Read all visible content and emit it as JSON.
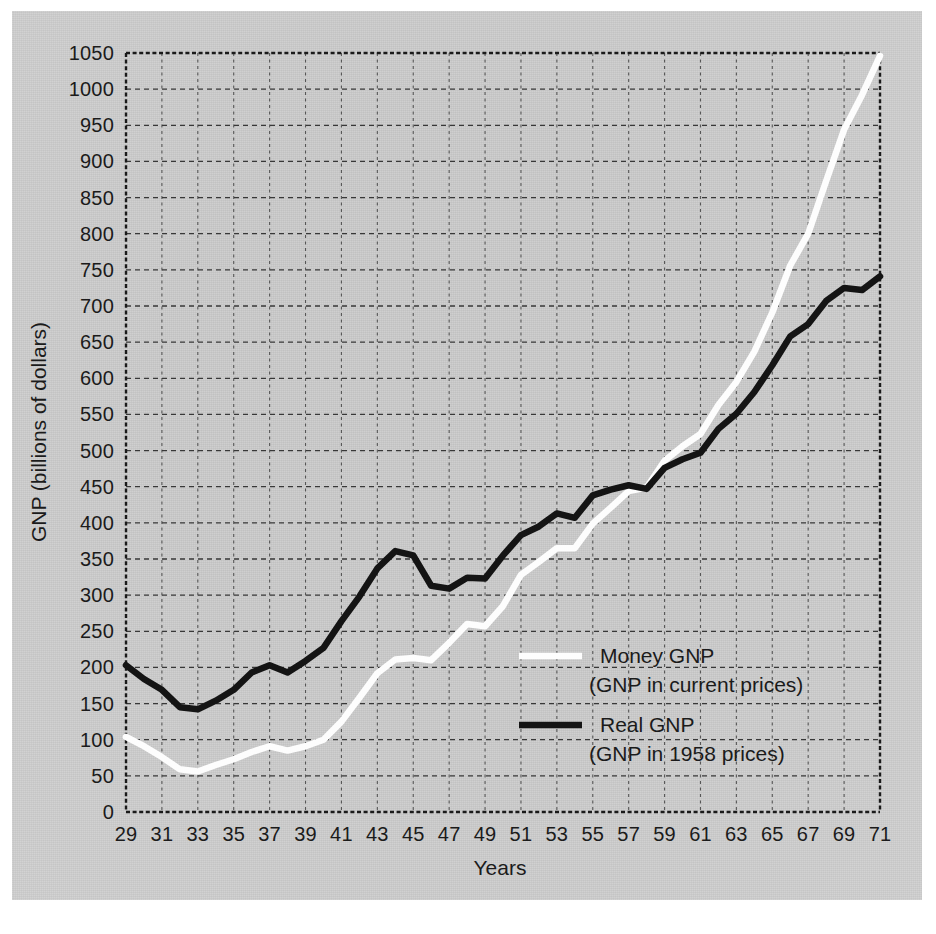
{
  "chart_data": {
    "type": "line",
    "title": "",
    "xlabel": "Years",
    "ylabel": "GNP (billions of dollars)",
    "xlim": [
      29,
      71
    ],
    "ylim": [
      0,
      1050
    ],
    "grid": true,
    "legend_position": "inside-right-lower",
    "x_tick_labels": [
      "29",
      "31",
      "33",
      "35",
      "37",
      "39",
      "41",
      "43",
      "45",
      "47",
      "49",
      "51",
      "53",
      "55",
      "57",
      "59",
      "61",
      "63",
      "65",
      "67",
      "69",
      "71"
    ],
    "y_tick_labels": [
      "0",
      "50",
      "100",
      "150",
      "200",
      "250",
      "300",
      "350",
      "400",
      "450",
      "500",
      "550",
      "600",
      "650",
      "700",
      "750",
      "800",
      "850",
      "900",
      "950",
      "1000",
      "1050"
    ],
    "x": [
      29,
      30,
      31,
      32,
      33,
      34,
      35,
      36,
      37,
      38,
      39,
      40,
      41,
      42,
      43,
      44,
      45,
      46,
      47,
      48,
      49,
      50,
      51,
      52,
      53,
      54,
      55,
      56,
      57,
      58,
      59,
      60,
      61,
      62,
      63,
      64,
      65,
      66,
      67,
      68,
      69,
      70,
      71
    ],
    "series": [
      {
        "name": "Money GNP",
        "sublabel": "(GNP in current prices)",
        "color": "#fdfdfd",
        "values": [
          104,
          91,
          76,
          59,
          56,
          65,
          73,
          83,
          91,
          85,
          91,
          100,
          125,
          158,
          192,
          211,
          213,
          210,
          234,
          260,
          257,
          285,
          328,
          346,
          365,
          365,
          399,
          421,
          444,
          449,
          486,
          506,
          523,
          563,
          595,
          637,
          691,
          756,
          800,
          873,
          944,
          992,
          1046
        ]
      },
      {
        "name": "Real GNP",
        "sublabel": "(GNP in 1958 prices)",
        "color": "#141414",
        "values": [
          203,
          184,
          169,
          145,
          142,
          154,
          169,
          193,
          203,
          193,
          209,
          227,
          264,
          298,
          337,
          361,
          355,
          313,
          309,
          324,
          323,
          355,
          383,
          395,
          413,
          407,
          438,
          446,
          452,
          447,
          476,
          488,
          497,
          530,
          551,
          581,
          618,
          658,
          675,
          707,
          725,
          722,
          741
        ]
      }
    ],
    "annotations": []
  },
  "axis": {
    "y_title": "GNP (billions of dollars)",
    "x_title": "Years"
  },
  "legend": {
    "money": {
      "label": "Money GNP",
      "sublabel": "(GNP in current prices)"
    },
    "real": {
      "label": "Real GNP",
      "sublabel": "(GNP in 1958 prices)"
    }
  }
}
